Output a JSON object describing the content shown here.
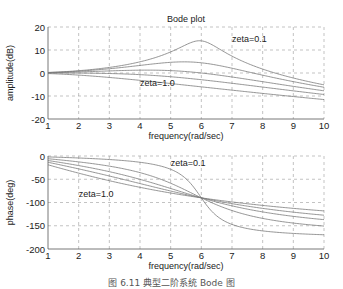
{
  "chart_data": [
    {
      "type": "line",
      "title": "Bode plot",
      "xlabel": "frequency(rad/sec)",
      "ylabel": "amplitude(dB)",
      "xlim": [
        1,
        10
      ],
      "ylim": [
        -20,
        20
      ],
      "xticks": [
        1,
        2,
        3,
        4,
        5,
        6,
        7,
        8,
        9,
        10
      ],
      "yticks": [
        20,
        10,
        0,
        -10,
        -20
      ],
      "grid": true,
      "annotations": [
        {
          "text": "zeta=0.1",
          "x": 7.0,
          "y": 13.5
        },
        {
          "text": "zeta=1.0",
          "x": 4.0,
          "y": -5.5
        }
      ],
      "natural_frequency": 6,
      "x": [
        1,
        2,
        3,
        4,
        5,
        6,
        7,
        8,
        9,
        10
      ],
      "series": [
        {
          "name": "zeta=0.1",
          "zeta": 0.1,
          "values": [
            0.24,
            1.0,
            2.48,
            4.86,
            9.17,
            13.98,
            7.33,
            1.7,
            -2.18,
            -5.15
          ]
        },
        {
          "name": "zeta=0.3",
          "zeta": 0.3,
          "values": [
            0.21,
            0.81,
            2.33,
            3.29,
            4.64,
            4.44,
            2.07,
            -0.95,
            -3.75,
            -6.19
          ]
        },
        {
          "name": "zeta=0.5",
          "zeta": 0.5,
          "values": [
            0.13,
            0.45,
            2.04,
            1.23,
            1.04,
            0.0,
            -1.73,
            -3.77,
            -5.81,
            -7.74
          ]
        },
        {
          "name": "zeta=0.7",
          "zeta": 0.7,
          "values": [
            0.03,
            -0.03,
            1.31,
            -0.72,
            -1.63,
            -2.92,
            -4.47,
            -6.12,
            -7.76,
            -9.35
          ]
        },
        {
          "name": "zeta=1.0",
          "zeta": 1.0,
          "values": [
            -0.24,
            -0.92,
            -1.94,
            -3.19,
            -4.58,
            -6.02,
            -7.46,
            -8.87,
            -10.24,
            -12.96
          ]
        }
      ]
    },
    {
      "type": "line",
      "title": "",
      "xlabel": "frequency(rad/sec)",
      "ylabel": "phase(deg)",
      "xlim": [
        1,
        10
      ],
      "ylim": [
        -200,
        0
      ],
      "xticks": [
        1,
        2,
        3,
        4,
        5,
        6,
        7,
        8,
        9,
        10
      ],
      "yticks": [
        0,
        -50,
        -100,
        -150,
        -200
      ],
      "grid": true,
      "annotations": [
        {
          "text": "zeta=0.1",
          "x": 5.0,
          "y": -22
        },
        {
          "text": "zeta=1.0",
          "x": 2.0,
          "y": -88
        }
      ],
      "natural_frequency": 6,
      "x": [
        1,
        2,
        3,
        4,
        5,
        6,
        7,
        8,
        9,
        10
      ],
      "series": [
        {
          "name": "zeta=0.1",
          "zeta": 0.1,
          "values": [
            -2,
            -4,
            -8,
            -16,
            -33,
            -90,
            -148,
            -163,
            -168,
            -170
          ]
        },
        {
          "name": "zeta=0.3",
          "zeta": 0.3,
          "values": [
            -6,
            -13,
            -22,
            -40,
            -64,
            -90,
            -128,
            -146,
            -154,
            -159
          ]
        },
        {
          "name": "zeta=0.5",
          "zeta": 0.5,
          "values": [
            -10,
            -21,
            -34,
            -50,
            -71,
            -90,
            -113,
            -130,
            -140,
            -146
          ]
        },
        {
          "name": "zeta=0.7",
          "zeta": 0.7,
          "values": [
            -14,
            -28,
            -43,
            -59,
            -75,
            -90,
            -106,
            -120,
            -130,
            -136
          ]
        },
        {
          "name": "zeta=1.0",
          "zeta": 1.0,
          "values": [
            -19,
            -37,
            -53,
            -67,
            -79,
            -90,
            -100,
            -110,
            -118,
            -124
          ]
        }
      ]
    }
  ],
  "caption": "图 6.11   典型二阶系统 Bode 图",
  "colors": {
    "line": "#7a7a7a",
    "grid": "#9a9a9a",
    "axis": "#555555",
    "text": "#222222"
  }
}
